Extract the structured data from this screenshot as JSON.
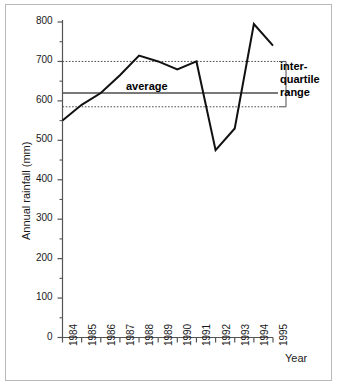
{
  "chart_data": {
    "type": "line",
    "title": "",
    "xlabel": "Year",
    "ylabel": "Annual rainfall (mm)",
    "x": [
      1984,
      1985,
      1986,
      1987,
      1988,
      1989,
      1990,
      1991,
      1992,
      1993,
      1994,
      1995
    ],
    "categories": [
      "1984",
      "1985",
      "1986",
      "1987",
      "1988",
      "1989",
      "1990",
      "1991",
      "1992",
      "1993",
      "1994",
      "1995"
    ],
    "values": [
      550,
      590,
      620,
      665,
      715,
      700,
      680,
      700,
      475,
      530,
      795,
      740
    ],
    "series": [
      {
        "name": "Annual rainfall",
        "values": [
          550,
          590,
          620,
          665,
          715,
          700,
          680,
          700,
          475,
          530,
          795,
          740
        ]
      }
    ],
    "ylim": [
      0,
      800
    ],
    "yticks": [
      0,
      100,
      200,
      300,
      400,
      500,
      600,
      700,
      800
    ],
    "ytick_labels": [
      "0",
      "100",
      "200",
      "300",
      "400",
      "500",
      "600",
      "700",
      "800"
    ],
    "yminor_step": 50,
    "xlim": [
      1984,
      1995
    ],
    "grid": false,
    "legend_position": "none",
    "reference_lines": [
      {
        "name": "average",
        "label": "average",
        "value": 620,
        "style": "solid",
        "color": "#4d4d4d"
      },
      {
        "name": "upper-quartile",
        "label": "",
        "value": 700,
        "style": "dotted",
        "color": "#4d4d4d"
      },
      {
        "name": "lower-quartile",
        "label": "",
        "value": 585,
        "style": "dotted",
        "color": "#4d4d4d"
      }
    ],
    "annotations": [
      {
        "name": "average-label",
        "text": "average",
        "value": 640
      },
      {
        "name": "interquartile-range-label",
        "text": "inter-quartile range",
        "lines": [
          "inter-",
          "quartile",
          "range"
        ],
        "range": [
          585,
          700
        ]
      }
    ],
    "line_color": "#111111",
    "axis_color": "#555555"
  },
  "axes": {
    "y_title": "Annual rainfall (mm)",
    "x_title": "Year",
    "y_ticks": [
      "800",
      "700",
      "600",
      "500",
      "400",
      "300",
      "200",
      "100",
      "0"
    ],
    "x_ticks": [
      "1984",
      "1985",
      "1986",
      "1987",
      "1988",
      "1989",
      "1990",
      "1991",
      "1992",
      "1993",
      "1994",
      "1995"
    ]
  },
  "annotations": {
    "average": "average",
    "iqr_line1": "inter-",
    "iqr_line2": "quartile",
    "iqr_line3": "range"
  },
  "colors": {
    "line": "#111111",
    "axis": "#555555",
    "reference": "#4d4d4d",
    "frame": "#b9b9b9",
    "text": "#1a1a1a",
    "background": "#ffffff"
  }
}
